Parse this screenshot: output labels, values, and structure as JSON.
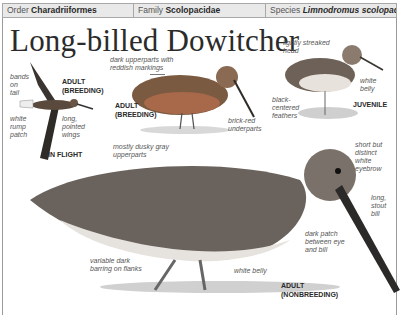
{
  "header": {
    "order_label": "Order",
    "order_value": "Charadriiformes",
    "family_label": "Family",
    "family_value": "Scolopacidae",
    "species_label": "Species",
    "species_value": "Limnodromus scolopaceus"
  },
  "title": "Long-billed Dowitcher",
  "figures": {
    "in_flight": {
      "caption": "IN FLIGHT",
      "labels": [
        "bands",
        "on",
        "tail",
        "white",
        "rump",
        "patch",
        "long,",
        "pointed",
        "wings"
      ]
    },
    "adult_breeding": {
      "caption_line1": "ADULT",
      "caption_line2": "(BREEDING)",
      "labels": [
        "dark upperparts with",
        "reddish markings",
        "brick-red",
        "underparts"
      ]
    },
    "flight_caption": {
      "line1": "ADULT",
      "line2": "(BREEDING)"
    },
    "juvenile": {
      "caption": "JUVENILE",
      "labels": [
        "lightly streaked",
        "head",
        "white",
        "belly",
        "black-",
        "centered",
        "feathers"
      ]
    },
    "adult_nonbreeding": {
      "caption_line1": "ADULT",
      "caption_line2": "(NONBREEDING)",
      "labels": [
        "mostly dusky gray",
        "upperparts",
        "short but",
        "distinct",
        "white",
        "eyebrow",
        "long,",
        "stout",
        "bill",
        "dark patch",
        "between eye",
        "and bill",
        "variable dark",
        "barring on flanks",
        "white belly"
      ]
    }
  },
  "colors": {
    "header_bg": "#e9e9e9",
    "border": "#9a9a9a",
    "text_dark": "#2a2a2a",
    "label_gray": "#555555"
  }
}
